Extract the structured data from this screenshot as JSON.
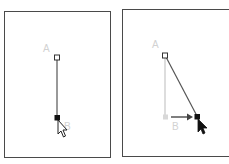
{
  "panels": [
    {
      "id": "before",
      "points": {
        "A": {
          "label": "A",
          "x": 57,
          "y": 57,
          "style": "hollow-square"
        },
        "B": {
          "label": "B",
          "x": 57,
          "y": 118,
          "style": "filled-square"
        }
      },
      "segment": {
        "from": "A",
        "to": "B"
      },
      "cursor": {
        "type": "hollow-arrow",
        "x": 58,
        "y": 120
      }
    },
    {
      "id": "after",
      "points": {
        "A": {
          "label": "A",
          "x": 165,
          "y": 55,
          "style": "hollow-square"
        },
        "B_original": {
          "label": "B",
          "x": 166,
          "y": 117,
          "style": "ghost-square"
        },
        "B_new": {
          "x": 197,
          "y": 117,
          "style": "filled-square"
        }
      },
      "ghost_segment": {
        "from": "A",
        "to": "B_original"
      },
      "segment": {
        "from": "A",
        "to": "B_new"
      },
      "drag_arrow": {
        "from_x": 171,
        "to_x": 192,
        "y": 117
      },
      "cursor": {
        "type": "filled-arrow",
        "x": 198,
        "y": 119
      }
    }
  ],
  "colors": {
    "frame": "#4a4a4a",
    "line": "#555555",
    "ghost": "#d2d2d2",
    "label": "#d2d2d2",
    "handle": "#111111"
  }
}
